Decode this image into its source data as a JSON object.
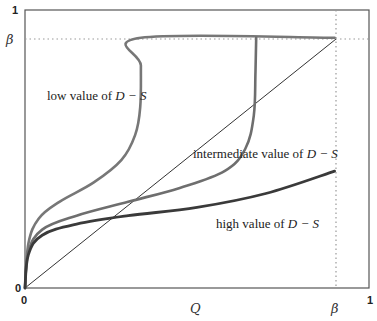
{
  "chart_data": {
    "type": "line",
    "title": "",
    "xlabel": "Q",
    "ylabel": "",
    "xlim": [
      0,
      1
    ],
    "ylim": [
      0,
      1
    ],
    "grid": false,
    "x_ticks": [
      {
        "value": 0,
        "label": "0"
      },
      {
        "value": 0.9,
        "label": "β"
      },
      {
        "value": 1,
        "label": "1"
      }
    ],
    "y_ticks": [
      {
        "value": 0,
        "label": "0"
      },
      {
        "value": 0.9,
        "label": "β"
      },
      {
        "value": 1,
        "label": "1"
      }
    ],
    "reference_lines": [
      {
        "name": "diagonal",
        "from": [
          0,
          0
        ],
        "to": [
          0.9,
          0.9
        ],
        "style": "solid-thin"
      },
      {
        "name": "beta-horizontal",
        "y": 0.9,
        "from_x": 0.9,
        "to_x": 1,
        "style": "dotted"
      },
      {
        "name": "beta-vertical",
        "x": 0.9,
        "from_y": 0,
        "to_y": 1,
        "style": "dotted"
      }
    ],
    "series": [
      {
        "name": "low value of D − S",
        "color": "#777777",
        "x": [
          0,
          0.01,
          0.04,
          0.1,
          0.2,
          0.28,
          0.32,
          0.335,
          0.337,
          0.337,
          0.9
        ],
        "y": [
          0,
          0.16,
          0.25,
          0.31,
          0.38,
          0.46,
          0.55,
          0.65,
          0.8,
          0.9,
          0.9
        ]
      },
      {
        "name": "intermediate value of D − S",
        "color": "#6e6e6e",
        "x": [
          0,
          0.01,
          0.05,
          0.15,
          0.3,
          0.45,
          0.58,
          0.64,
          0.665,
          0.67,
          0.672
        ],
        "y": [
          0,
          0.13,
          0.21,
          0.26,
          0.31,
          0.36,
          0.42,
          0.5,
          0.62,
          0.78,
          0.9
        ]
      },
      {
        "name": "high value of D − S",
        "color": "#3a3a3a",
        "x": [
          0,
          0.01,
          0.05,
          0.15,
          0.3,
          0.5,
          0.7,
          0.9
        ],
        "y": [
          0,
          0.12,
          0.19,
          0.23,
          0.26,
          0.29,
          0.34,
          0.42
        ]
      }
    ],
    "annotations": [
      {
        "text": "low value of D − S",
        "x": 0.05,
        "y": 0.73
      },
      {
        "text": "intermediate value of D − S",
        "x": 0.56,
        "y": 0.5
      },
      {
        "text": "high value of D − S",
        "x": 0.56,
        "y": 0.24
      }
    ]
  },
  "labels": {
    "y_one": "1",
    "y_beta": "β",
    "y_zero": "0",
    "x_zero": "0",
    "x_label": "Q",
    "x_beta": "β",
    "x_one": "1",
    "ann_low_prefix": "low value of ",
    "ann_mid_prefix": "intermediate value of ",
    "ann_high_prefix": "high value of ",
    "ann_expr": "D − S"
  }
}
